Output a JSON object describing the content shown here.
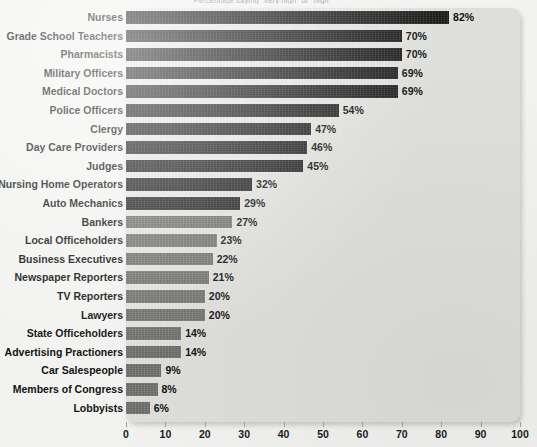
{
  "subtitle": "Percentage saying \"very high\" or \"high\"",
  "axis": {
    "ticks": [
      0,
      10,
      20,
      30,
      40,
      50,
      60,
      70,
      80,
      90,
      100
    ],
    "min": 0,
    "max": 100
  },
  "colors": {
    "bar_dark": "#1c1c1c",
    "bar_light": "#737371",
    "panel": "#dededa",
    "page_background": "#f2f2f0",
    "text": "#121212"
  },
  "chart_data": {
    "type": "bar",
    "orientation": "horizontal",
    "title": "",
    "subtitle": "Percentage saying \"very high\" or \"high\"",
    "xlabel": "",
    "ylabel": "",
    "xlim": [
      0,
      100
    ],
    "grid": false,
    "legend": "none",
    "value_suffix": "%",
    "categories": [
      "Nurses",
      "Grade School Teachers",
      "Pharmacists",
      "Military Officers",
      "Medical Doctors",
      "Police Officers",
      "Clergy",
      "Day Care Providers",
      "Judges",
      "Nursing Home Operators",
      "Auto Mechanics",
      "Bankers",
      "Local Officeholders",
      "Business Executives",
      "Newspaper Reporters",
      "TV Reporters",
      "Lawyers",
      "State Officeholders",
      "Advertising Practioners",
      "Car Salespeople",
      "Members of Congress",
      "Lobbyists"
    ],
    "values": [
      82,
      70,
      70,
      69,
      69,
      54,
      47,
      46,
      45,
      32,
      29,
      27,
      23,
      22,
      21,
      20,
      20,
      14,
      14,
      9,
      8,
      6
    ],
    "value_labels": [
      "82%",
      "70%",
      "70%",
      "69%",
      "69%",
      "54%",
      "47%",
      "46%",
      "45%",
      "32%",
      "29%",
      "27%",
      "23%",
      "22%",
      "21%",
      "20%",
      "20%",
      "14%",
      "14%",
      "9%",
      "8%",
      "6%"
    ],
    "bar_shades": [
      "dark",
      "dark",
      "dark",
      "dark",
      "dark",
      "dark",
      "dark",
      "dark",
      "dark",
      "dark",
      "dark",
      "light",
      "light",
      "light",
      "light",
      "light",
      "light",
      "light",
      "light",
      "light",
      "light",
      "light"
    ]
  }
}
